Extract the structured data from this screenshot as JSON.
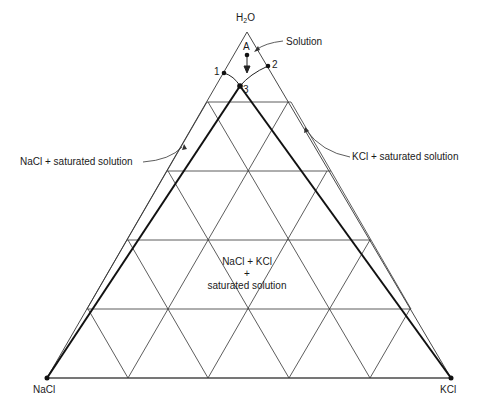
{
  "diagram": {
    "type": "ternary-phase-diagram",
    "vertices": {
      "top": {
        "label": "H",
        "sub": "2",
        "label_after": "O"
      },
      "bottom_left": {
        "label": "NaCl"
      },
      "bottom_right": {
        "label": "KCl"
      }
    },
    "points": {
      "A": "A",
      "p1": "1",
      "p2": "2",
      "p3": "3"
    },
    "regions": {
      "solution": "Solution",
      "nacl_saturated": "NaCl + saturated solution",
      "kcl_saturated": "KCl + saturated solution",
      "mixed_line1": "NaCl + KCl",
      "mixed_line2": "+",
      "mixed_line3": "saturated solution"
    },
    "grid_divisions": 5,
    "colors": {
      "line": "#2a2a2a",
      "thick_line": "#111111",
      "text": "#1a1a1a"
    }
  }
}
